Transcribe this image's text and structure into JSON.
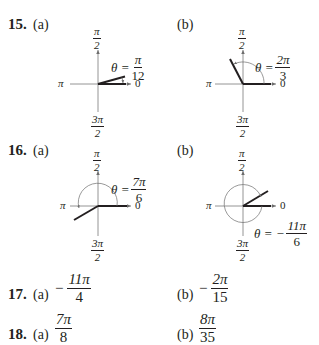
{
  "problems": [
    {
      "number": "15.",
      "parts": [
        {
          "label": "(a)",
          "theta_lhs": "θ =",
          "theta_num": "π",
          "theta_den": "12",
          "axes": {
            "top_num": "π",
            "top_den": "2",
            "left": "π",
            "right": "0",
            "bottom_num": "3π",
            "bottom_den": "2"
          }
        },
        {
          "label": "(b)",
          "theta_lhs": "θ =",
          "theta_num": "2π",
          "theta_den": "3",
          "axes": {
            "top_num": "π",
            "top_den": "2",
            "left": "π",
            "right": "0",
            "bottom_num": "3π",
            "bottom_den": "2"
          }
        }
      ]
    },
    {
      "number": "16.",
      "parts": [
        {
          "label": "(a)",
          "theta_lhs": "θ =",
          "theta_num": "7π",
          "theta_den": "6",
          "axes": {
            "top_num": "π",
            "top_den": "2",
            "left": "π",
            "right": "0",
            "bottom_num": "3π",
            "bottom_den": "2"
          }
        },
        {
          "label": "(b)",
          "theta_lhs": "θ = −",
          "theta_num": "11π",
          "theta_den": "6",
          "axes": {
            "top_num": "π",
            "top_den": "2",
            "left": "π",
            "right": "0",
            "bottom_num": "3π",
            "bottom_den": "2"
          }
        }
      ]
    },
    {
      "number": "17.",
      "parts": [
        {
          "label": "(a)",
          "sign": "−",
          "num": "11π",
          "den": "4"
        },
        {
          "label": "(b)",
          "sign": "−",
          "num": "2π",
          "den": "15"
        }
      ]
    },
    {
      "number": "18.",
      "parts": [
        {
          "label": "(a)",
          "sign": "",
          "num": "7π",
          "den": "8"
        },
        {
          "label": "(b)",
          "sign": "",
          "num": "8π",
          "den": "35"
        }
      ]
    }
  ]
}
